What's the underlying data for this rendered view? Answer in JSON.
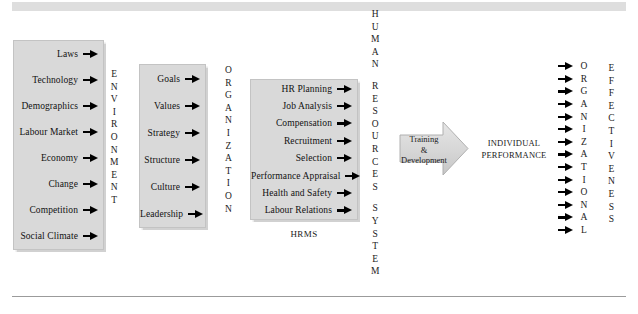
{
  "diagram": {
    "title_bar": "",
    "environment_box": {
      "name": "Environment",
      "items": [
        "Laws",
        "Technology",
        "Demographics",
        "Labour Market",
        "Economy",
        "Change",
        "Competition",
        "Social Climate"
      ]
    },
    "environment_label": "ENVIRONMENT",
    "organization_box": {
      "name": "Organization",
      "items": [
        "Goals",
        "Values",
        "Strategy",
        "Structure",
        "Culture",
        "Leadership"
      ]
    },
    "organization_label": "ORGANIZATION",
    "hrms_box": {
      "name": "HRMS",
      "items": [
        "HR Planning",
        "Job Analysis",
        "Compensation",
        "Recruitment",
        "Selection",
        "Performance Appraisal",
        "Health and Safety",
        "Labour Relations"
      ],
      "caption": "HRMS"
    },
    "human_resources_system_label": {
      "word1": "HUMAN",
      "word2": "RESOURCES",
      "word3": "SYSTEM"
    },
    "training_arrow": {
      "line1": "Training",
      "line2": "&",
      "line3": "Development"
    },
    "individual_performance": {
      "line1": "INDIVIDUAL",
      "line2": "PERFORMANCE"
    },
    "organizational_label": "ORGANIZATIONAL",
    "effectiveness_label": "EFFECTIVENESS",
    "colors": {
      "box_fill": "#d9d9d9",
      "box_border": "#c3c3c3",
      "bar_fill": "#dedede",
      "rule": "#9b9b9b",
      "text": "#111111"
    }
  }
}
